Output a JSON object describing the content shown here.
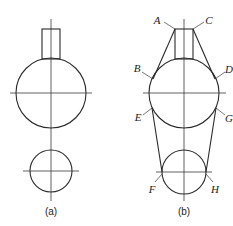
{
  "figure_a": {
    "caption": "(a)"
  },
  "figure_b": {
    "caption": "(b)",
    "point_labels": {
      "A": "A",
      "B": "B",
      "C": "C",
      "D": "D",
      "E": "E",
      "F": "F",
      "G": "G",
      "H": "H"
    }
  },
  "colors": {
    "line": "#2a2a2a",
    "background": "#ffffff"
  }
}
